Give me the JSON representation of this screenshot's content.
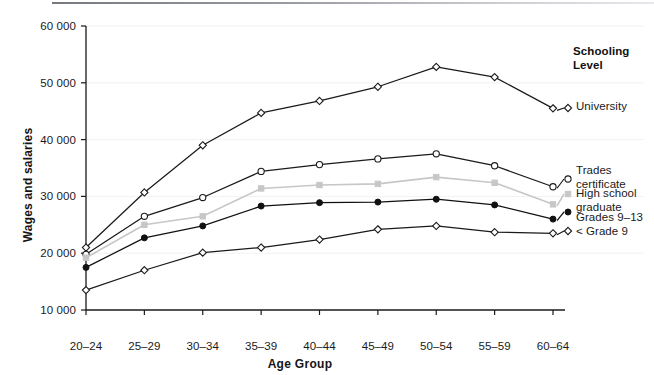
{
  "chart_data": {
    "type": "line",
    "title": "",
    "xlabel": "Age Group",
    "ylabel": "Wages and salaries",
    "categories": [
      "20–24",
      "25–29",
      "30–34",
      "35–39",
      "40–44",
      "45–49",
      "50–54",
      "55–59",
      "60–64"
    ],
    "ylim": [
      10000,
      60000
    ],
    "yticks": [
      10000,
      20000,
      30000,
      40000,
      50000,
      60000
    ],
    "ytick_labels": [
      "10 000",
      "20 000",
      "30 000",
      "40 000",
      "50 000",
      "60 000"
    ],
    "grid": "horizontal-faint",
    "legend_position": "right",
    "legend_title": "Schooling\nLevel",
    "series": [
      {
        "name": "University",
        "legend_label": "University",
        "marker": "diamond-open",
        "color": "#1a1a1a",
        "values": [
          21000,
          30700,
          39000,
          44700,
          46800,
          49300,
          52800,
          51000,
          45500
        ]
      },
      {
        "name": "Trades certificate",
        "legend_label": "Trades\ncertificate",
        "marker": "circle-open",
        "color": "#1a1a1a",
        "values": [
          19800,
          26500,
          29800,
          34400,
          35600,
          36600,
          37500,
          35400,
          31700
        ]
      },
      {
        "name": "High school graduate",
        "legend_label": "High school\ngraduate",
        "marker": "square-filled-light",
        "color": "#c7c7c7",
        "values": [
          19200,
          25000,
          26500,
          31400,
          32000,
          32200,
          33400,
          32400,
          28600
        ]
      },
      {
        "name": "Grades 9–13",
        "legend_label": "Grades 9–13",
        "marker": "circle-filled",
        "color": "#111111",
        "values": [
          17500,
          22700,
          24800,
          28300,
          28900,
          29000,
          29500,
          28500,
          26000
        ]
      },
      {
        "name": "< Grade 9",
        "legend_label": "< Grade 9",
        "marker": "diamond-open",
        "color": "#1a1a1a",
        "values": [
          13500,
          17000,
          20100,
          21000,
          22400,
          24200,
          24800,
          23700,
          23500
        ]
      }
    ]
  },
  "axis": {
    "y_title": "Wages and salaries",
    "x_title": "Age Group"
  },
  "legend": {
    "title_line1": "Schooling",
    "title_line2": "Level"
  },
  "colors": {
    "axis": "#1a1a1a",
    "text": "#151515",
    "series_light": "#c7c7c7",
    "series_dark": "#1a1a1a",
    "grid": "#f2f2f2"
  }
}
